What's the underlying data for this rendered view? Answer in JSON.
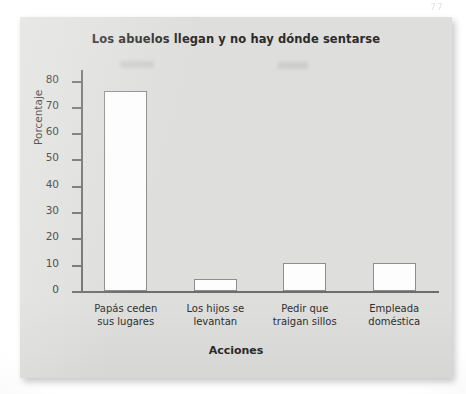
{
  "page": {
    "artifact_mark": "77"
  },
  "chart_data": {
    "type": "bar",
    "title": "Los abuelos llegan y no hay dónde sentarse",
    "xlabel": "Acciones",
    "ylabel": "Porcentaje",
    "categories": [
      "Papás ceden sus lugares",
      "Los hijos se levantan",
      "Pedir que traigan sillos",
      "Empleada doméstica"
    ],
    "category_lines": [
      [
        "Papás ceden",
        "sus lugares"
      ],
      [
        "Los hijos se",
        "levantan"
      ],
      [
        "Pedir que",
        "traigan sillos"
      ],
      [
        "Empleada",
        "doméstica"
      ]
    ],
    "values": [
      76,
      4.5,
      10.5,
      10.5
    ],
    "ylim": [
      0,
      84
    ],
    "yticks": [
      0,
      10,
      20,
      30,
      40,
      50,
      60,
      70,
      80
    ],
    "ytick_labels": [
      "0",
      "10",
      "20",
      "30",
      "40",
      "50",
      "60",
      "70",
      "80"
    ],
    "grid": false,
    "legend": null,
    "colors": {
      "panel_background": "#dededc",
      "bar_fill": "#fdfdfd",
      "bar_border": "#8d8d8d",
      "axis": "#6d6d6d",
      "text": "#2b2b2b"
    }
  }
}
